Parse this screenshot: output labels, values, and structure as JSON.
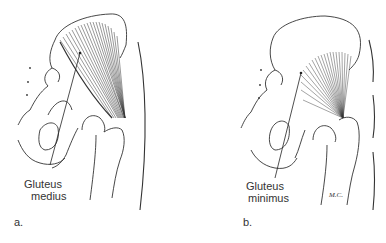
{
  "figure": {
    "panels": [
      {
        "id": "a",
        "letter": "a.",
        "label_line1": "Gluteus",
        "label_line2": "medius",
        "muscle": "gluteus-medius"
      },
      {
        "id": "b",
        "letter": "b.",
        "label_line1": "Gluteus",
        "label_line2": "minimus",
        "muscle": "gluteus-minimus",
        "signature": "M.C."
      }
    ]
  }
}
